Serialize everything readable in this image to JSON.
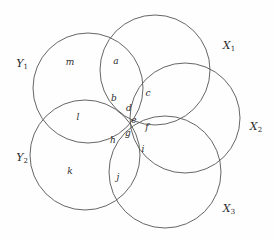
{
  "figure": {
    "type": "venn-diagram",
    "title": "",
    "background_color": "#fefefe",
    "stroke_color": "#555555",
    "text_color": "#2b2b2b",
    "width": 274,
    "height": 240
  },
  "sets": [
    {
      "id": "Y1",
      "base": "Y",
      "sub": "1",
      "label": "Y₁",
      "cx": 88,
      "cy": 88,
      "r": 55,
      "label_x": 22,
      "label_y": 63
    },
    {
      "id": "X1",
      "base": "X",
      "sub": "1",
      "label": "X₁",
      "cx": 155,
      "cy": 70,
      "r": 55,
      "label_x": 229,
      "label_y": 45
    },
    {
      "id": "X2",
      "base": "X",
      "sub": "2",
      "label": "X₂",
      "cx": 185,
      "cy": 118,
      "r": 55,
      "label_x": 256,
      "label_y": 126
    },
    {
      "id": "Y2",
      "base": "Y",
      "sub": "2",
      "label": "Y₂",
      "cx": 85,
      "cy": 155,
      "r": 55,
      "label_x": 22,
      "label_y": 157
    },
    {
      "id": "X3",
      "base": "X",
      "sub": "3",
      "label": "X₃",
      "cx": 165,
      "cy": 172,
      "r": 56,
      "label_x": 229,
      "label_y": 208
    }
  ],
  "regions": [
    {
      "id": "m",
      "label": "m",
      "x": 70,
      "y": 62
    },
    {
      "id": "a",
      "label": "a",
      "x": 116,
      "y": 61
    },
    {
      "id": "c",
      "label": "c",
      "x": 148,
      "y": 93
    },
    {
      "id": "b",
      "label": "b",
      "x": 114,
      "y": 98
    },
    {
      "id": "l",
      "label": "l",
      "x": 78,
      "y": 117
    },
    {
      "id": "d",
      "label": "d",
      "x": 129,
      "y": 108
    },
    {
      "id": "e",
      "label": "e",
      "x": 134,
      "y": 120
    },
    {
      "id": "f",
      "label": "f",
      "x": 147,
      "y": 127
    },
    {
      "id": "g",
      "label": "g",
      "x": 128,
      "y": 133
    },
    {
      "id": "h",
      "label": "h",
      "x": 113,
      "y": 140
    },
    {
      "id": "i",
      "label": "i",
      "x": 143,
      "y": 149
    },
    {
      "id": "k",
      "label": "k",
      "x": 70,
      "y": 171
    },
    {
      "id": "j",
      "label": "j",
      "x": 118,
      "y": 177
    }
  ]
}
